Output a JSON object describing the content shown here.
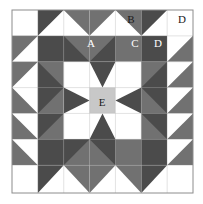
{
  "diagram": {
    "kind": "quilt-block-pattern",
    "grid": {
      "cols": 7,
      "rows": 7,
      "cell": 25.857,
      "origin_x": 12,
      "origin_y": 10
    },
    "palette": {
      "white": "#ffffff",
      "light_gray": "#c8c8c8",
      "medium_gray": "#717171",
      "dark_gray": "#4b4b4b",
      "outline": "#8c8c8c",
      "label_light": "#ffffff",
      "label_dark": "#1a1a1a"
    },
    "labels": [
      {
        "id": "A",
        "text": "A",
        "x": 91,
        "y": 44,
        "tone": "light",
        "patch": "half-square-triangle-star-point"
      },
      {
        "id": "B",
        "text": "B",
        "x": 131,
        "y": 20,
        "tone": "dark",
        "patch": "corner-triangle"
      },
      {
        "id": "C",
        "text": "C",
        "x": 135,
        "y": 44,
        "tone": "light",
        "patch": "medium-square"
      },
      {
        "id": "D1",
        "text": "D",
        "x": 158,
        "y": 44,
        "tone": "light",
        "patch": "dark-corner-square"
      },
      {
        "id": "D2",
        "text": "D",
        "x": 182,
        "y": 20,
        "tone": "dark",
        "patch": "white-corner-square"
      },
      {
        "id": "E",
        "text": "E",
        "x": 102,
        "y": 103,
        "tone": "dark",
        "patch": "center-square"
      }
    ],
    "legend_keys": [
      "A",
      "B",
      "C",
      "D",
      "E"
    ]
  }
}
